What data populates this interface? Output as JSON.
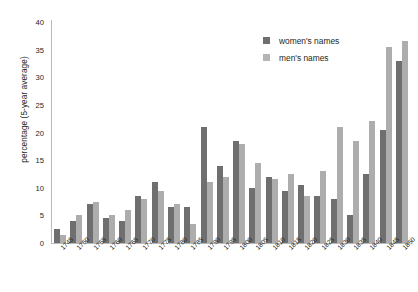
{
  "chart_data": {
    "type": "bar",
    "title": "",
    "subtitle": "",
    "xlabel": "",
    "ylabel": "percentage (5-year average)",
    "ylim": [
      0,
      40
    ],
    "yticks": [
      0,
      5,
      10,
      15,
      20,
      25,
      30,
      35,
      40
    ],
    "grid": false,
    "legend_position": "top-right",
    "categories": [
      "1745",
      "1750",
      "1755",
      "1760",
      "1765",
      "1770",
      "1775",
      "1780",
      "1785",
      "1790",
      "1795",
      "1800",
      "1805",
      "1810",
      "1815",
      "1820",
      "1825",
      "1830",
      "1835",
      "1840",
      "1845",
      "1850"
    ],
    "series": [
      {
        "name": "women's names",
        "color": "#6f6f6f",
        "values": [
          2.5,
          4.0,
          7.0,
          4.5,
          4.0,
          8.5,
          11.0,
          6.5,
          6.5,
          21.0,
          14.0,
          18.5,
          10.0,
          12.0,
          9.5,
          10.5,
          8.5,
          8.0,
          5.0,
          12.5,
          20.5,
          33.0
        ]
      },
      {
        "name": "men's names",
        "color": "#adadad",
        "values": [
          1.5,
          5.0,
          7.5,
          5.0,
          6.0,
          8.0,
          9.5,
          7.0,
          3.5,
          11.0,
          12.0,
          18.0,
          14.5,
          11.5,
          12.5,
          8.5,
          13.0,
          21.0,
          18.5,
          22.0,
          35.5,
          36.5
        ]
      }
    ]
  },
  "legend": {
    "items": [
      {
        "label": "women's names"
      },
      {
        "label": "men's names"
      }
    ]
  }
}
